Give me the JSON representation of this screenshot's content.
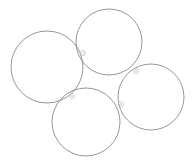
{
  "canvas": {
    "width": 193,
    "height": 165,
    "background_color": "#ffffff"
  },
  "style": {
    "circle_stroke_color": "#8a8a8a",
    "circle_stroke_width": 0.9,
    "circle_fill": "none",
    "marker_stroke_color": "#b4b4b4",
    "marker_dot_color": "#c8c8c8",
    "marker_stroke_width": 0.6,
    "marker_radius": 2.6,
    "marker_dot_radius": 0.9
  },
  "chart_data": {
    "type": "scatter",
    "title": "",
    "xlabel": "",
    "ylabel": "",
    "grid": false,
    "legend": null,
    "xlim": [
      0,
      193
    ],
    "ylim": [
      0,
      165
    ],
    "shapes": [
      {
        "id": "circle-left",
        "name": "left-circle",
        "cx": 47,
        "cy": 67,
        "r": 36
      },
      {
        "id": "circle-top",
        "name": "top-circle",
        "cx": 109,
        "cy": 42,
        "r": 33
      },
      {
        "id": "circle-right",
        "name": "right-circle",
        "cx": 151,
        "cy": 97,
        "r": 33
      },
      {
        "id": "circle-bottom",
        "name": "bottom-circle",
        "cx": 86,
        "cy": 122,
        "r": 34
      }
    ],
    "markers": [
      {
        "id": "tangency-left-top",
        "name": "tangency-point-left-top",
        "x": 83,
        "y": 53
      },
      {
        "id": "tangency-top-right",
        "name": "tangency-point-top-right",
        "x": 136,
        "y": 71
      },
      {
        "id": "tangency-left-bottom",
        "name": "tangency-point-left-bottom",
        "x": 72,
        "y": 96
      },
      {
        "id": "tangency-right-bottom",
        "name": "tangency-point-right-bottom",
        "x": 121,
        "y": 104
      }
    ]
  }
}
